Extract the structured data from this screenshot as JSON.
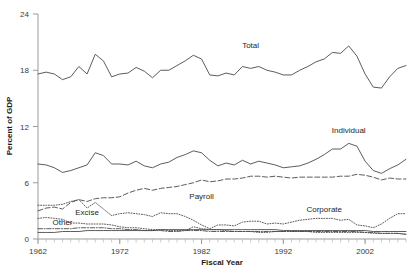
{
  "chart_data": {
    "type": "line",
    "title": "",
    "xlabel": "Fiscal Year",
    "ylabel": "Percent of GDP",
    "xlim": [
      1962,
      2007
    ],
    "ylim": [
      0,
      24
    ],
    "ytick_labels": [
      "0",
      "6",
      "12",
      "18",
      "24"
    ],
    "ytick_values": [
      0,
      6,
      12,
      18,
      24
    ],
    "xtick_labels": [
      "1962",
      "1972",
      "1982",
      "1992",
      "2002"
    ],
    "xtick_values": [
      1962,
      1972,
      1982,
      1992,
      2002
    ],
    "grid": false,
    "legend_position": "inline-annotations",
    "x": [
      1962,
      1963,
      1964,
      1965,
      1966,
      1967,
      1968,
      1969,
      1970,
      1971,
      1972,
      1973,
      1974,
      1975,
      1976,
      1977,
      1978,
      1979,
      1980,
      1981,
      1982,
      1983,
      1984,
      1985,
      1986,
      1987,
      1988,
      1989,
      1990,
      1991,
      1992,
      1993,
      1994,
      1995,
      1996,
      1997,
      1998,
      1999,
      2000,
      2001,
      2002,
      2003,
      2004,
      2005,
      2006,
      2007
    ],
    "series": [
      {
        "name": "Total",
        "linestyle": "solid",
        "label": "Total",
        "label_x": 1988,
        "label_y": 20.4,
        "values": [
          17.6,
          17.8,
          17.6,
          17.0,
          17.3,
          18.4,
          17.6,
          19.7,
          19.0,
          17.3,
          17.6,
          17.7,
          18.3,
          17.9,
          17.2,
          18.0,
          18.0,
          18.5,
          19.0,
          19.6,
          19.2,
          17.5,
          17.4,
          17.7,
          17.5,
          18.4,
          18.2,
          18.4,
          18.0,
          17.8,
          17.5,
          17.5,
          18.0,
          18.4,
          18.9,
          19.2,
          19.9,
          19.8,
          20.6,
          19.5,
          17.6,
          16.2,
          16.1,
          17.3,
          18.2,
          18.5
        ]
      },
      {
        "name": "Individual",
        "linestyle": "solid",
        "label": "Individual",
        "label_x": 2000,
        "label_y": 11.3,
        "values": [
          8.0,
          7.9,
          7.6,
          7.1,
          7.3,
          7.6,
          7.9,
          9.2,
          8.9,
          8.0,
          8.0,
          7.9,
          8.3,
          7.8,
          7.6,
          8.0,
          8.2,
          8.7,
          9.0,
          9.4,
          9.2,
          8.4,
          7.8,
          8.1,
          7.9,
          8.4,
          8.0,
          8.3,
          8.1,
          7.9,
          7.6,
          7.7,
          7.8,
          8.1,
          8.5,
          9.0,
          9.6,
          9.6,
          10.2,
          9.9,
          8.3,
          7.3,
          7.0,
          7.5,
          7.9,
          8.5
        ]
      },
      {
        "name": "Payroll",
        "linestyle": "dashed",
        "label": "Payroll",
        "label_x": 1982,
        "label_y": 4.3,
        "values": [
          3.0,
          3.3,
          3.4,
          3.2,
          3.9,
          4.2,
          4.0,
          4.3,
          4.4,
          4.4,
          4.5,
          4.9,
          5.2,
          5.4,
          5.2,
          5.4,
          5.5,
          5.6,
          5.8,
          6.0,
          6.3,
          6.1,
          6.2,
          6.4,
          6.4,
          6.5,
          6.7,
          6.7,
          6.6,
          6.7,
          6.6,
          6.5,
          6.6,
          6.6,
          6.6,
          6.6,
          6.6,
          6.7,
          6.7,
          6.9,
          6.8,
          6.6,
          6.3,
          6.5,
          6.4,
          6.4
        ]
      },
      {
        "name": "Corporate",
        "linestyle": "dotted",
        "label": "Corporate",
        "label_x": 1997,
        "label_y": 2.9,
        "values": [
          3.6,
          3.6,
          3.6,
          3.7,
          4.0,
          4.2,
          3.3,
          3.9,
          3.2,
          2.5,
          2.7,
          2.8,
          2.7,
          2.6,
          2.4,
          2.8,
          2.7,
          2.7,
          2.4,
          2.0,
          1.5,
          1.1,
          1.5,
          1.5,
          1.4,
          1.8,
          1.9,
          1.9,
          1.6,
          1.7,
          1.6,
          1.8,
          2.0,
          2.1,
          2.2,
          2.2,
          2.2,
          2.0,
          2.1,
          1.5,
          1.4,
          1.2,
          1.6,
          2.2,
          2.7,
          2.7
        ]
      },
      {
        "name": "Excise",
        "linestyle": "dotted",
        "label": "Excise",
        "label_x": 1968,
        "label_y": 2.6,
        "values": [
          2.2,
          2.3,
          2.2,
          2.1,
          1.7,
          1.7,
          1.6,
          1.6,
          1.6,
          1.5,
          1.3,
          1.2,
          1.2,
          1.1,
          1.0,
          1.0,
          0.9,
          0.9,
          0.9,
          1.3,
          1.1,
          1.0,
          1.0,
          0.9,
          0.8,
          0.8,
          0.8,
          0.7,
          0.7,
          0.8,
          0.8,
          0.8,
          0.8,
          0.8,
          0.7,
          0.7,
          0.7,
          0.7,
          0.7,
          0.7,
          0.7,
          0.6,
          0.6,
          0.6,
          0.6,
          0.5
        ]
      },
      {
        "name": "Other",
        "linestyle": "dashdot",
        "label": "Other",
        "label_x": 1965,
        "label_y": 1.5,
        "values": [
          1.1,
          1.1,
          1.1,
          1.1,
          1.1,
          1.2,
          1.2,
          1.2,
          1.2,
          1.1,
          1.1,
          1.0,
          1.0,
          0.9,
          0.9,
          0.9,
          0.8,
          0.8,
          0.9,
          0.9,
          0.9,
          0.8,
          0.8,
          0.8,
          0.8,
          0.8,
          0.8,
          0.8,
          0.8,
          0.8,
          0.8,
          0.8,
          0.8,
          0.8,
          0.8,
          0.8,
          0.8,
          0.8,
          0.8,
          0.8,
          0.7,
          0.7,
          0.6,
          0.6,
          0.6,
          0.5
        ]
      },
      {
        "name": "Other-solid",
        "linestyle": "solid",
        "label": "",
        "label_x": null,
        "label_y": null,
        "values": [
          0.7,
          0.7,
          0.7,
          0.8,
          0.8,
          0.8,
          0.9,
          0.9,
          0.9,
          0.9,
          0.9,
          0.9,
          0.9,
          0.9,
          0.9,
          1.0,
          1.0,
          1.0,
          1.0,
          1.0,
          1.0,
          1.0,
          1.0,
          1.0,
          1.0,
          1.0,
          1.0,
          1.0,
          1.0,
          1.0,
          0.9,
          0.9,
          0.9,
          0.9,
          0.9,
          0.9,
          0.9,
          0.9,
          0.9,
          0.9,
          0.9,
          0.8,
          0.8,
          0.8,
          0.8,
          0.8
        ]
      }
    ]
  },
  "colors": {
    "line": "#4a4a4a",
    "axis": "#9a9a9a",
    "text": "#262626",
    "background": "#ffffff"
  }
}
